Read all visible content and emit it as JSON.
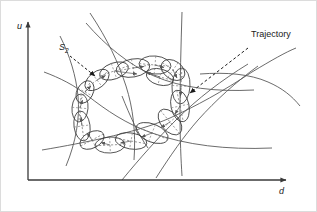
{
  "figure": {
    "title_present": false,
    "background_color": "#ffffff",
    "stroke_color": "#4d4d4d",
    "axis_color": "#3a3a3a",
    "text_color": "#1a1a1a",
    "border_color": "#d9d9d9",
    "axes": {
      "y_axis_label": "u",
      "x_axis_label": "d",
      "y_axis_arrow": "up-arrow",
      "x_axis_arrow": "right-arrow"
    },
    "annotations": [
      {
        "id": "s2",
        "text": "S",
        "subscript": "2",
        "pointer": "dashed-arrow"
      },
      {
        "id": "trajectory",
        "text": "Trajectory",
        "pointer": "dashed-arrow"
      }
    ]
  },
  "chart_data": {
    "type": "diagram",
    "title": "",
    "xlabel": "d",
    "ylabel": "u",
    "grid": false,
    "legend": "none",
    "ellipse_chain": {
      "count": 16,
      "note": "Overlapping tilted ellipses forming one closed loop with dashed major axes and small direction arrows",
      "ellipses": [
        {
          "cx": 133,
          "cy": 68,
          "rx": 17,
          "ry": 9,
          "rot": -10
        },
        {
          "cx": 155,
          "cy": 65,
          "rx": 16,
          "ry": 9,
          "rot": 5
        },
        {
          "cx": 173,
          "cy": 70,
          "rx": 13,
          "ry": 9,
          "rot": 35
        },
        {
          "cx": 181,
          "cy": 86,
          "rx": 9,
          "ry": 18,
          "rot": 3
        },
        {
          "cx": 180,
          "cy": 106,
          "rx": 9,
          "ry": 16,
          "rot": -12
        },
        {
          "cx": 170,
          "cy": 122,
          "rx": 15,
          "ry": 9,
          "rot": 50
        },
        {
          "cx": 152,
          "cy": 133,
          "rx": 17,
          "ry": 9,
          "rot": 22
        },
        {
          "cx": 131,
          "cy": 141,
          "rx": 16,
          "ry": 8,
          "rot": 10
        },
        {
          "cx": 110,
          "cy": 145,
          "rx": 15,
          "ry": 8,
          "rot": -3
        },
        {
          "cx": 92,
          "cy": 140,
          "rx": 13,
          "ry": 8,
          "rot": -28
        },
        {
          "cx": 82,
          "cy": 126,
          "rx": 8,
          "ry": 15,
          "rot": -8
        },
        {
          "cx": 80,
          "cy": 108,
          "rx": 8,
          "ry": 14,
          "rot": 5
        },
        {
          "cx": 85,
          "cy": 92,
          "rx": 12,
          "ry": 8,
          "rot": -62
        },
        {
          "cx": 97,
          "cy": 80,
          "rx": 14,
          "ry": 8,
          "rot": -38
        },
        {
          "cx": 114,
          "cy": 71,
          "rx": 15,
          "ry": 8,
          "rot": -20
        },
        {
          "cx": 160,
          "cy": 77,
          "rx": 14,
          "ry": 8,
          "rot": 15
        }
      ]
    },
    "background_curves": 9,
    "axis_ranges": {
      "x": [
        28,
        290
      ],
      "y": [
        20,
        180
      ]
    }
  }
}
